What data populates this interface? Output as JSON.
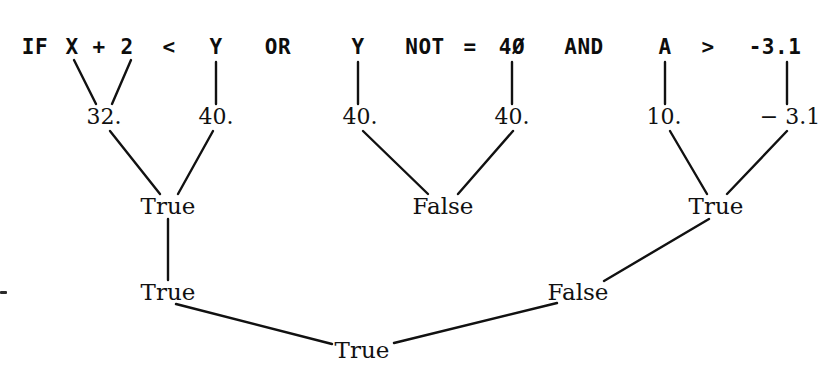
{
  "diagram": {
    "colors": {
      "ink": "#0d0d0d",
      "line": "#111111",
      "background": "#ffffff"
    },
    "expression_line": {
      "full_text": "IF X + 2 < Y  OR  Y  NOT = 4Ø  AND  A > -3.1",
      "tokens": [
        {
          "text": "IF",
          "x": 35,
          "y": 47
        },
        {
          "text": "X",
          "x": 72,
          "y": 47
        },
        {
          "text": "+",
          "x": 99,
          "y": 47
        },
        {
          "text": "2",
          "x": 127,
          "y": 47
        },
        {
          "text": "<",
          "x": 169,
          "y": 47
        },
        {
          "text": "Y",
          "x": 216,
          "y": 47
        },
        {
          "text": "OR",
          "x": 278,
          "y": 47
        },
        {
          "text": "Y",
          "x": 358,
          "y": 47
        },
        {
          "text": "NOT",
          "x": 425,
          "y": 47
        },
        {
          "text": "=",
          "x": 470,
          "y": 47
        },
        {
          "text": "4Ø",
          "x": 512,
          "y": 47
        },
        {
          "text": "AND",
          "x": 584,
          "y": 47
        },
        {
          "text": "A",
          "x": 665,
          "y": 47
        },
        {
          "text": ">",
          "x": 708,
          "y": 47
        },
        {
          "text": "-3.1",
          "x": 775,
          "y": 47
        }
      ]
    },
    "levels": [
      {
        "name": "operand-values",
        "nodes": [
          {
            "id": "v-32",
            "text": "32.",
            "x": 104,
            "y": 117
          },
          {
            "id": "v-40a",
            "text": "40.",
            "x": 216,
            "y": 117
          },
          {
            "id": "v-40b",
            "text": "40.",
            "x": 360,
            "y": 117
          },
          {
            "id": "v-40c",
            "text": "40.",
            "x": 512,
            "y": 117
          },
          {
            "id": "v-10",
            "text": "10.",
            "x": 664,
            "y": 117
          },
          {
            "id": "v-neg31",
            "text": "− 3.1",
            "x": 790,
            "y": 117
          }
        ]
      },
      {
        "name": "comparison-results",
        "nodes": [
          {
            "id": "r-lt",
            "text": "True",
            "x": 168,
            "y": 206
          },
          {
            "id": "r-eq",
            "text": "False",
            "x": 443,
            "y": 206
          },
          {
            "id": "r-gt",
            "text": "True",
            "x": 716,
            "y": 206
          }
        ]
      },
      {
        "name": "logical-results",
        "nodes": [
          {
            "id": "l-or",
            "text": "True",
            "x": 168,
            "y": 292
          },
          {
            "id": "l-and",
            "text": "False",
            "x": 578,
            "y": 292
          }
        ]
      },
      {
        "name": "final-result",
        "nodes": [
          {
            "id": "f-if",
            "text": "True",
            "x": 362,
            "y": 350
          }
        ]
      }
    ],
    "edges": [
      {
        "from": "X",
        "to": "v-32",
        "x1": 74,
        "y1": 60,
        "x2": 96,
        "y2": 104
      },
      {
        "from": "2",
        "to": "v-32",
        "x1": 131,
        "y1": 60,
        "x2": 112,
        "y2": 104
      },
      {
        "from": "Y1",
        "to": "v-40a",
        "x1": 216,
        "y1": 62,
        "x2": 216,
        "y2": 104
      },
      {
        "from": "Y2",
        "to": "v-40b",
        "x1": 358,
        "y1": 62,
        "x2": 358,
        "y2": 104
      },
      {
        "from": "40",
        "to": "v-40c",
        "x1": 512,
        "y1": 62,
        "x2": 512,
        "y2": 104
      },
      {
        "from": "A",
        "to": "v-10",
        "x1": 665,
        "y1": 62,
        "x2": 665,
        "y2": 104
      },
      {
        "from": "-3.1",
        "to": "v-neg31",
        "x1": 787,
        "y1": 62,
        "x2": 787,
        "y2": 104
      },
      {
        "from": "v-32",
        "to": "r-lt",
        "x1": 110,
        "y1": 131,
        "x2": 160,
        "y2": 194
      },
      {
        "from": "v-40a",
        "to": "r-lt",
        "x1": 213,
        "y1": 131,
        "x2": 178,
        "y2": 194
      },
      {
        "from": "v-40b",
        "to": "r-eq",
        "x1": 363,
        "y1": 131,
        "x2": 428,
        "y2": 194
      },
      {
        "from": "v-40c",
        "to": "r-eq",
        "x1": 513,
        "y1": 131,
        "x2": 458,
        "y2": 194
      },
      {
        "from": "v-10",
        "to": "r-gt",
        "x1": 670,
        "y1": 131,
        "x2": 707,
        "y2": 194
      },
      {
        "from": "v-neg31",
        "to": "r-gt",
        "x1": 787,
        "y1": 131,
        "x2": 727,
        "y2": 194
      },
      {
        "from": "r-lt",
        "to": "l-or",
        "x1": 168,
        "y1": 219,
        "x2": 168,
        "y2": 280
      },
      {
        "from": "r-gt",
        "to": "l-and",
        "x1": 709,
        "y1": 219,
        "x2": 604,
        "y2": 281
      },
      {
        "from": "l-or",
        "to": "f-if",
        "x1": 176,
        "y1": 304,
        "x2": 332,
        "y2": 344
      },
      {
        "from": "l-and",
        "to": "f-if",
        "x1": 557,
        "y1": 303,
        "x2": 394,
        "y2": 343
      }
    ],
    "marks": [
      {
        "id": "left-edge-speck",
        "x": 0,
        "y": 291
      }
    ]
  }
}
